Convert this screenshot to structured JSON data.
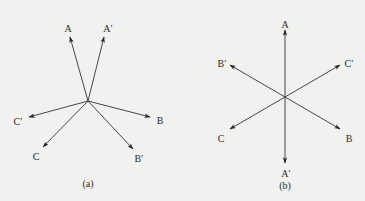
{
  "figure": {
    "panels": [
      {
        "id": "a",
        "caption": "(a)",
        "center": [
          88,
          101
        ],
        "caption_pos": [
          88,
          185
        ],
        "vectors": [
          {
            "name": "A",
            "label": "A",
            "tip": [
              70,
              37
            ],
            "label_pos": [
              68,
              30
            ]
          },
          {
            "name": "A'",
            "label": "A′",
            "tip": [
              104,
              37
            ],
            "label_pos": [
              108,
              30
            ]
          },
          {
            "name": "B",
            "label": "B",
            "tip": [
              150,
              117
            ],
            "label_pos": [
              160,
              122
            ]
          },
          {
            "name": "B'",
            "label": "B′",
            "tip": [
              133,
              149
            ],
            "label_pos": [
              139,
              160
            ]
          },
          {
            "name": "C",
            "label": "C",
            "tip": [
              43,
              147
            ],
            "label_pos": [
              36,
              158
            ]
          },
          {
            "name": "C'",
            "label": "C′",
            "tip": [
              29,
              117
            ],
            "label_pos": [
              18,
              123
            ]
          }
        ]
      },
      {
        "id": "b",
        "caption": "(b)",
        "center": [
          285,
          97
        ],
        "caption_pos": [
          285,
          187
        ],
        "vectors": [
          {
            "name": "A",
            "label": "A",
            "tip": [
              285,
              30
            ],
            "label_pos": [
              285,
              26
            ]
          },
          {
            "name": "A'",
            "label": "A′",
            "tip": [
              285,
              163
            ],
            "label_pos": [
              286,
              175
            ]
          },
          {
            "name": "B'",
            "label": "B′",
            "tip": [
              230,
              65
            ],
            "label_pos": [
              222,
              65
            ]
          },
          {
            "name": "C'",
            "label": "C′",
            "tip": [
              340,
              65
            ],
            "label_pos": [
              349,
              65
            ]
          },
          {
            "name": "C",
            "label": "C",
            "tip": [
              230,
              129
            ],
            "label_pos": [
              221,
              140
            ]
          },
          {
            "name": "B",
            "label": "B",
            "tip": [
              340,
              129
            ],
            "label_pos": [
              349,
              140
            ]
          }
        ]
      }
    ]
  }
}
